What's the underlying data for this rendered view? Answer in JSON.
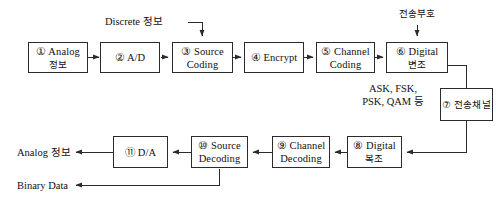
{
  "diagram": {
    "stroke_color": "#2b2b2b",
    "background": "#ffffff",
    "blocks": [
      {
        "id": "b1",
        "marker": "①",
        "line1": "① Analog",
        "line2": "정보"
      },
      {
        "id": "b2",
        "marker": "②",
        "line1": "② A/D",
        "line2": ""
      },
      {
        "id": "b3",
        "marker": "③",
        "line1": "③ Source",
        "line2": "Coding"
      },
      {
        "id": "b4",
        "marker": "④",
        "line1": "④ Encrypt",
        "line2": ""
      },
      {
        "id": "b5",
        "marker": "⑤",
        "line1": "⑤ Channel",
        "line2": "Coding"
      },
      {
        "id": "b6",
        "marker": "⑥",
        "line1": "⑥ Digital",
        "line2": "변조"
      },
      {
        "id": "b7",
        "marker": "⑦",
        "line1": "⑦ 전송채널",
        "line2": ""
      },
      {
        "id": "b8",
        "marker": "⑧",
        "line1": "⑧ Digital",
        "line2": "복조"
      },
      {
        "id": "b9",
        "marker": "⑨",
        "line1": "⑨ Channel",
        "line2": "Decoding"
      },
      {
        "id": "b10",
        "marker": "⑩",
        "line1": "⑩ Source",
        "line2": "Decoding"
      },
      {
        "id": "b11",
        "marker": "⑪",
        "line1": "⑪ D/A",
        "line2": ""
      }
    ],
    "labels": {
      "discrete_input": "Discrete 정보",
      "transmission_code": "전송부호",
      "modulation_types_line1": "ASK, FSK,",
      "modulation_types_line2": "PSK, QAM 등",
      "analog_output": "Analog 정보",
      "binary_output": "Binary Data"
    }
  }
}
